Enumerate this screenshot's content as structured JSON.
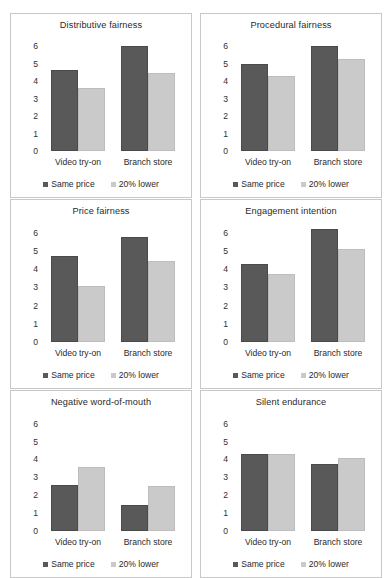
{
  "figure": {
    "categories": [
      "Video try-on",
      "Branch store"
    ],
    "legend": [
      {
        "label": "Same price",
        "color": "#595959",
        "swatch": "dark"
      },
      {
        "label": "20% lower",
        "color": "#cacaca",
        "swatch": "light"
      }
    ],
    "yticks": [
      "6",
      "5",
      "4",
      "3",
      "2",
      "1",
      "0"
    ],
    "ymax": 6.6,
    "colors": {
      "same_price": "#595959",
      "lower_price": "#cacaca",
      "panel_border": "#c8c8c8",
      "text": "#2a2a2a"
    }
  },
  "chart_data": [
    {
      "type": "bar",
      "title": "Distributive fairness",
      "categories": [
        "Video try-on",
        "Branch store"
      ],
      "series": [
        {
          "name": "Same price",
          "values": [
            4.65,
            6.05
          ]
        },
        {
          "name": "20% lower",
          "values": [
            3.6,
            4.5
          ]
        }
      ],
      "xlabel": "",
      "ylabel": "",
      "ylim": [
        0,
        6.6
      ],
      "yticks": [
        0,
        1,
        2,
        3,
        4,
        5,
        6
      ],
      "grid": false,
      "legend_position": "bottom"
    },
    {
      "type": "bar",
      "title": "Procedural fairness",
      "categories": [
        "Video try-on",
        "Branch store"
      ],
      "series": [
        {
          "name": "Same price",
          "values": [
            5.0,
            6.05
          ]
        },
        {
          "name": "20% lower",
          "values": [
            4.3,
            5.3
          ]
        }
      ],
      "xlabel": "",
      "ylabel": "",
      "ylim": [
        0,
        6.6
      ],
      "yticks": [
        0,
        1,
        2,
        3,
        4,
        5,
        6
      ],
      "grid": false,
      "legend_position": "bottom"
    },
    {
      "type": "bar",
      "title": "Price fairness",
      "categories": [
        "Video try-on",
        "Branch store"
      ],
      "series": [
        {
          "name": "Same price",
          "values": [
            4.75,
            5.75
          ]
        },
        {
          "name": "20% lower",
          "values": [
            3.1,
            4.45
          ]
        }
      ],
      "xlabel": "",
      "ylabel": "",
      "ylim": [
        0,
        6.6
      ],
      "yticks": [
        0,
        1,
        2,
        3,
        4,
        5,
        6
      ],
      "grid": false,
      "legend_position": "bottom"
    },
    {
      "type": "bar",
      "title": "Engagement intention",
      "categories": [
        "Video try-on",
        "Branch store"
      ],
      "series": [
        {
          "name": "Same price",
          "values": [
            4.3,
            6.2
          ]
        },
        {
          "name": "20% lower",
          "values": [
            3.75,
            5.1
          ]
        }
      ],
      "xlabel": "",
      "ylabel": "",
      "ylim": [
        0,
        6.6
      ],
      "yticks": [
        0,
        1,
        2,
        3,
        4,
        5,
        6
      ],
      "grid": false,
      "legend_position": "bottom"
    },
    {
      "type": "bar",
      "title": "Negative word-of-mouth",
      "categories": [
        "Video try-on",
        "Branch store"
      ],
      "series": [
        {
          "name": "Same price",
          "values": [
            2.6,
            1.45
          ]
        },
        {
          "name": "20% lower",
          "values": [
            3.6,
            2.5
          ]
        }
      ],
      "xlabel": "",
      "ylabel": "",
      "ylim": [
        0,
        6.6
      ],
      "yticks": [
        0,
        1,
        2,
        3,
        4,
        5,
        6
      ],
      "grid": false,
      "legend_position": "bottom"
    },
    {
      "type": "bar",
      "title": "Silent endurance",
      "categories": [
        "Video try-on",
        "Branch store"
      ],
      "series": [
        {
          "name": "Same price",
          "values": [
            4.3,
            3.75
          ]
        },
        {
          "name": "20% lower",
          "values": [
            4.3,
            4.1
          ]
        }
      ],
      "xlabel": "",
      "ylabel": "",
      "ylim": [
        0,
        6.6
      ],
      "yticks": [
        0,
        1,
        2,
        3,
        4,
        5,
        6
      ],
      "grid": false,
      "legend_position": "bottom"
    }
  ]
}
